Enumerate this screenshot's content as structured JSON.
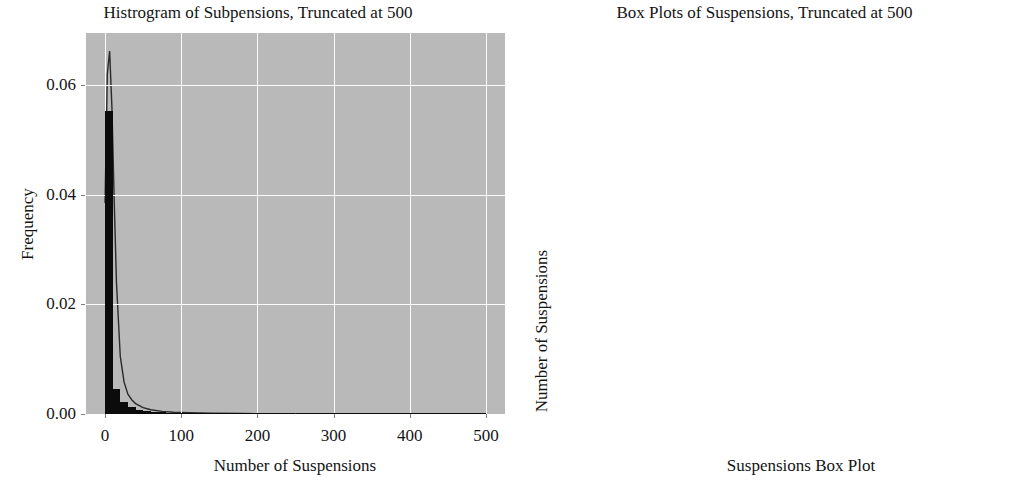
{
  "figure": {
    "background_color": "#ffffff",
    "panel_background_color": "#b9b9b9",
    "grid_color": "#fbfbfb",
    "mark_color": "#0b0b0b"
  },
  "chart_data": [
    {
      "type": "bar",
      "id": "histogram",
      "title": "Histrogram of Subpensions, Truncated at 500",
      "xlabel": "Number of Suspensions",
      "ylabel": "Frequency",
      "xlim": [
        -25,
        525
      ],
      "ylim": [
        0,
        0.0695
      ],
      "grid": true,
      "xticks": [
        0,
        100,
        200,
        300,
        400,
        500
      ],
      "xticklabels": [
        "0",
        "100",
        "200",
        "300",
        "400",
        "500"
      ],
      "yticks": [
        0.0,
        0.02,
        0.04,
        0.06
      ],
      "yticklabels": [
        "0.00",
        "0.02",
        "0.04",
        "0.06"
      ],
      "bin_width": 10,
      "bin_centers": [
        5,
        15,
        25,
        35,
        45,
        55,
        65,
        75,
        85,
        95,
        105,
        115,
        125,
        135,
        145,
        155,
        165,
        175,
        185,
        195,
        205,
        215,
        225,
        235,
        245,
        255,
        265,
        275,
        285,
        295,
        305,
        315,
        325,
        335,
        345,
        355,
        365,
        375,
        385,
        395,
        405,
        415,
        425,
        435,
        445,
        455,
        465,
        475,
        485,
        495
      ],
      "values": [
        0.0552,
        0.00465,
        0.00215,
        0.00125,
        0.00075,
        0.00052,
        0.00038,
        0.00029,
        0.00023,
        0.00019,
        0.00016,
        0.00013,
        0.00011,
        0.0001,
        9e-05,
        8e-05,
        7e-05,
        6e-05,
        5.5e-05,
        5e-05,
        4.5e-05,
        4e-05,
        3.8e-05,
        3.5e-05,
        3.2e-05,
        3e-05,
        2.8e-05,
        2.6e-05,
        2.4e-05,
        2.2e-05,
        2e-05,
        1.9e-05,
        1.8e-05,
        1.7e-05,
        1.6e-05,
        1.5e-05,
        1.4e-05,
        1.3e-05,
        1.2e-05,
        1.1e-05,
        1e-05,
        1e-05,
        9e-06,
        9e-06,
        8e-06,
        8e-06,
        7e-06,
        7e-06,
        6e-06,
        6e-06
      ],
      "kde": {
        "label": "kde-overlay",
        "x": [
          0,
          3,
          6,
          9,
          12,
          15,
          20,
          25,
          30,
          35,
          40,
          50,
          60,
          75,
          90,
          110,
          140,
          180,
          230,
          290,
          360,
          430,
          500
        ],
        "y": [
          0.0385,
          0.062,
          0.0662,
          0.056,
          0.039,
          0.024,
          0.0105,
          0.0058,
          0.0036,
          0.0026,
          0.0019,
          0.00115,
          0.00078,
          0.00048,
          0.00033,
          0.00022,
          0.00013,
          8e-05,
          5e-05,
          3e-05,
          2e-05,
          1e-05,
          5e-06
        ]
      }
    },
    {
      "type": "scatter",
      "id": "boxplot",
      "title": "Box Plots of Suspensions, Truncated at 500",
      "xlabel": "Suspensions Box Plot",
      "ylabel": "Number of Suspensions",
      "xlim": [
        0.555,
        1.445
      ],
      "ylim": [
        -28,
        522
      ],
      "grid": true,
      "xticks": [
        0.6,
        0.8,
        1.0,
        1.2,
        1.4
      ],
      "xticklabels": [
        "0.6",
        "0.8",
        "1.0",
        "1.2",
        "1.4"
      ],
      "yticks": [
        0,
        100,
        200,
        300,
        400,
        500
      ],
      "yticklabels": [
        "0",
        "100",
        "200",
        "300",
        "400",
        "500"
      ],
      "box": {
        "category": 1.0,
        "q1": 0,
        "median": 1,
        "q3": 2,
        "whisker_low": 0,
        "whisker_high": 4,
        "box_width_data": 0.8
      },
      "outliers_x": 1.0,
      "outliers_y": [
        500,
        434,
        400,
        250,
        215,
        185,
        176,
        168,
        160,
        152,
        148,
        142,
        137,
        132,
        128,
        124,
        120,
        116,
        112,
        108,
        104,
        100,
        97,
        94,
        91,
        88,
        85,
        82,
        80,
        78,
        76,
        74,
        72,
        70,
        68,
        66,
        64,
        62,
        60,
        58,
        56,
        54,
        52,
        50,
        48,
        47,
        46,
        45,
        44,
        43,
        42,
        41,
        40,
        39,
        38,
        37,
        36,
        35,
        34,
        33,
        32,
        31,
        30,
        29,
        28,
        27,
        26,
        25,
        24,
        23,
        22,
        21,
        20,
        19,
        18,
        17,
        16,
        15,
        14,
        13,
        12,
        11,
        10,
        9,
        8,
        7,
        6,
        5
      ]
    }
  ]
}
